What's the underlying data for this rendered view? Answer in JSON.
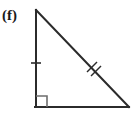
{
  "figure": {
    "label": "(f)",
    "type": "right-triangle-diagram",
    "background_color": "#ffffff",
    "stroke_color": "#2b2b2b",
    "label_color": "#1a1a1a"
  },
  "geometry": {
    "vertices": {
      "apex_top_left": {
        "x": 36,
        "y": 10
      },
      "right_angle_bottom_left": {
        "x": 36,
        "y": 107
      },
      "bottom_right": {
        "x": 129,
        "y": 107
      }
    },
    "sides": [
      {
        "name": "vertical-leg",
        "from": "apex_top_left",
        "to": "right_angle_bottom_left",
        "tick_marks": 1
      },
      {
        "name": "horizontal-leg",
        "from": "right_angle_bottom_left",
        "to": "bottom_right",
        "tick_marks": 0
      },
      {
        "name": "hypotenuse",
        "from": "apex_top_left",
        "to": "bottom_right",
        "tick_marks": 2
      }
    ],
    "right_angle_marker": {
      "at": "right_angle_bottom_left",
      "size": 11
    },
    "stroke_width": 2
  },
  "marks": {
    "vertical_leg_tick": {
      "x": 36,
      "y": 63,
      "half_length": 5
    },
    "hypotenuse_tick_a": {
      "x": 92,
      "y": 67
    },
    "hypotenuse_tick_b": {
      "x": 96,
      "y": 71
    }
  }
}
